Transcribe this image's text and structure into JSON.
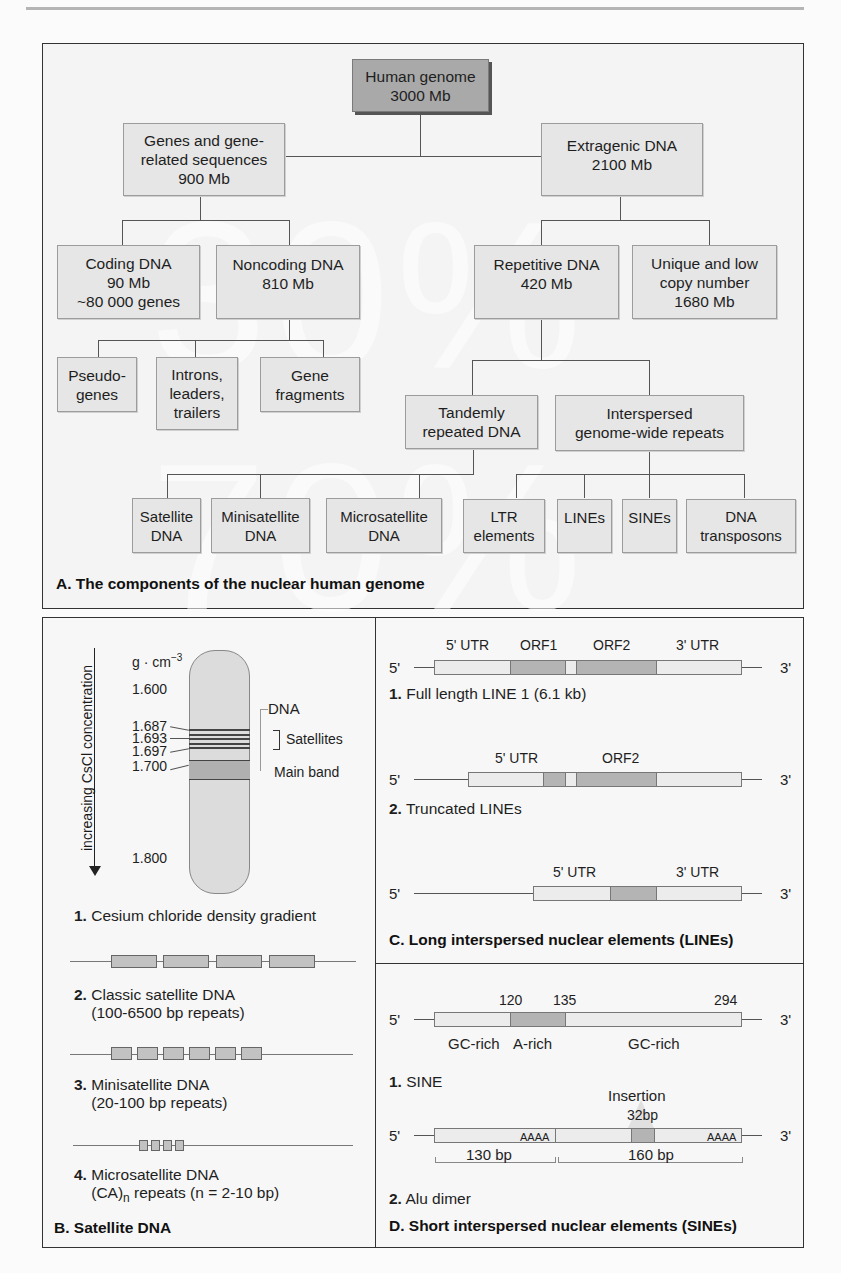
{
  "page": {
    "header_rule": true
  },
  "panelA": {
    "caption": "A. The components of the nuclear human genome",
    "watermark": "30%   70%",
    "root": "Human genome\n3000 Mb",
    "level1": [
      {
        "label": "Genes and gene-\nrelated sequences\n900 Mb"
      },
      {
        "label": "Extragenic DNA\n2100 Mb"
      }
    ],
    "level2": [
      {
        "label": "Coding DNA\n90 Mb\n~80 000 genes"
      },
      {
        "label": "Noncoding DNA\n810 Mb"
      },
      {
        "label": "Repetitive DNA\n420 Mb"
      },
      {
        "label": "Unique and low\ncopy number\n1680 Mb"
      }
    ],
    "noncoding_children": [
      {
        "label": "Pseudo-\ngenes"
      },
      {
        "label": "Introns,\nleaders,\ntrailers"
      },
      {
        "label": "Gene\nfragments"
      }
    ],
    "repetitive_children": [
      {
        "label": "Tandemly\nrepeated DNA"
      },
      {
        "label": "Interspersed\ngenome-wide repeats"
      }
    ],
    "tandem_children": [
      {
        "label": "Satellite\nDNA"
      },
      {
        "label": "Minisatellite\nDNA"
      },
      {
        "label": "Microsatellite\nDNA"
      }
    ],
    "interspersed_children": [
      {
        "label": "LTR\nelements"
      },
      {
        "label": "LINEs"
      },
      {
        "label": "SINEs"
      },
      {
        "label": "DNA\ntransposons"
      }
    ]
  },
  "panelB": {
    "caption": "B. Satellite DNA",
    "axis_label": "increasing CsCl concentration",
    "unit": "g · cm",
    "unit_exp": "−3",
    "densities": [
      "1.600",
      "1.687",
      "1.693",
      "1.697",
      "1.700",
      "1.800"
    ],
    "labels": {
      "dna": "DNA",
      "satellites": "Satellites",
      "main_band": "Main band"
    },
    "items": [
      {
        "num": "1.",
        "text": "Cesium chloride density gradient",
        "text2": ""
      },
      {
        "num": "2.",
        "text": "Classic satellite DNA",
        "text2": "(100-6500 bp repeats)"
      },
      {
        "num": "3.",
        "text": "Minisatellite DNA",
        "text2": "(20-100 bp repeats)"
      },
      {
        "num": "4.",
        "text": "Microsatellite DNA",
        "text2_pre": "(CA)",
        "text2_sub": "n",
        "text2_post": " repeats (n = 2-10 bp)"
      }
    ]
  },
  "panelC": {
    "caption": "C. Long interspersed nuclear elements (LINEs)",
    "five_prime": "5'",
    "three_prime": "3'",
    "line1": {
      "labels": [
        "5' UTR",
        "ORF1",
        "ORF2",
        "3' UTR"
      ],
      "num": "1.",
      "text": "Full length LINE 1 (6.1 kb)"
    },
    "line2": {
      "labels": [
        "5' UTR",
        "ORF2"
      ],
      "num": "2.",
      "text": "Truncated LINEs"
    },
    "line3": {
      "labels": [
        "5' UTR",
        "3' UTR"
      ]
    }
  },
  "panelD": {
    "caption": "D. Short interspersed nuclear elements (SINEs)",
    "five_prime": "5'",
    "three_prime": "3'",
    "sine": {
      "positions": [
        "120",
        "135",
        "294"
      ],
      "regions": [
        "GC-rich",
        "A-rich",
        "GC-rich"
      ],
      "num": "1.",
      "text": "SINE"
    },
    "alu": {
      "insertion": "Insertion",
      "insertion_size": "32bp",
      "polyA": "AAAA",
      "left_len": "130 bp",
      "right_len": "160 bp",
      "num": "2.",
      "text": "Alu dimer"
    }
  }
}
